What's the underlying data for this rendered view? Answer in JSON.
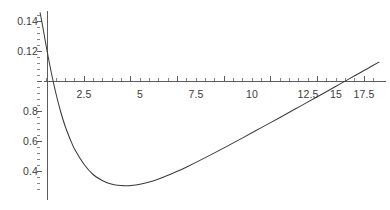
{
  "chart_data": {
    "type": "line",
    "title": "",
    "subtitle": "",
    "xlabel": "",
    "ylabel": "",
    "grid": false,
    "legend": null,
    "axis_origin_value": {
      "x": 0,
      "y": 0.1
    },
    "xlim": [
      0,
      18.3
    ],
    "ylim": [
      0.025,
      0.147
    ],
    "xticks": [
      {
        "value": 2.5,
        "label": "2.5",
        "px": 84
      },
      {
        "value": 5,
        "label": "5",
        "px": 140
      },
      {
        "value": 7.5,
        "label": "7.5",
        "px": 196
      },
      {
        "value": 10,
        "label": "10",
        "px": 252
      },
      {
        "value": 12.5,
        "label": "12.5",
        "px": 308
      },
      {
        "value": 15,
        "label": "15",
        "px": 336
      },
      {
        "value": 17.5,
        "label": "17.5",
        "px": 364
      }
    ],
    "yticks": [
      {
        "value": 0.14,
        "label": "0.14",
        "px": 21
      },
      {
        "value": 0.12,
        "label": "0.12",
        "px": 51
      },
      {
        "value": 0.1,
        "label": "",
        "px": 81
      },
      {
        "value": 0.08,
        "label": "0.8",
        "px": 111
      },
      {
        "value": 0.06,
        "label": "0.6",
        "px": 141
      },
      {
        "value": 0.04,
        "label": "0.4",
        "px": 171
      }
    ],
    "series": [
      {
        "name": "curve",
        "color": "#3a3a3a",
        "x": [
          0.15,
          0.3,
          0.5,
          0.75,
          1.0,
          1.25,
          1.5,
          1.75,
          2.0,
          2.5,
          3.0,
          3.5,
          4.0,
          4.5,
          4.8,
          5.0,
          5.5,
          6.0,
          6.5,
          7.0,
          7.5,
          8.0,
          9.0,
          10.0,
          11.0,
          12.0,
          13.0,
          14.0,
          15.0,
          16.0,
          16.3,
          17.0,
          17.5,
          18.0,
          18.3
        ],
        "y": [
          0.1455,
          0.1355,
          0.1215,
          0.1055,
          0.0915,
          0.0795,
          0.0695,
          0.0615,
          0.0545,
          0.0445,
          0.0375,
          0.0335,
          0.0312,
          0.0303,
          0.0302,
          0.0303,
          0.0312,
          0.0327,
          0.0347,
          0.0371,
          0.0398,
          0.0427,
          0.0489,
          0.0554,
          0.0621,
          0.0689,
          0.0757,
          0.0826,
          0.0895,
          0.0965,
          0.0986,
          0.1035,
          0.107,
          0.1105,
          0.1126
        ]
      }
    ],
    "annotations": [],
    "notes": {
      "axis_color": "#4a4a4a",
      "curve_color": "#3a3a3a",
      "background": "#ffffff",
      "x_axis_drawn_at_y_value": 0.1,
      "minimum": {
        "x": 4.8,
        "y": 0.0302
      },
      "axis_crossing_x": 16.3
    }
  }
}
